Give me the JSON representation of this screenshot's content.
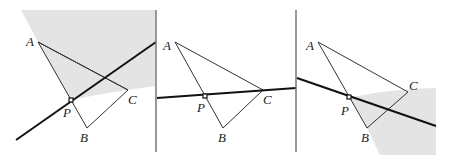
{
  "figure": {
    "colors": {
      "shade": "#e4e4e4",
      "line": "#111111",
      "divider": "#777777"
    },
    "panels": [
      {
        "id": "panel-1",
        "labels": {
          "A": "A",
          "B": "B",
          "C": "C",
          "P": "P"
        },
        "line_through_P": "steep line crossing AC",
        "shaded_region": "above/left, bounded by AP and curve"
      },
      {
        "id": "panel-2",
        "labels": {
          "A": "A",
          "B": "B",
          "C": "C",
          "P": "P"
        },
        "line_through_P": "line through P and C",
        "shaded_region": "none"
      },
      {
        "id": "panel-3",
        "labels": {
          "A": "A",
          "B": "B",
          "C": "C",
          "P": "P"
        },
        "line_through_P": "line crossing BC",
        "shaded_region": "below/right, bounded by PB"
      }
    ]
  }
}
